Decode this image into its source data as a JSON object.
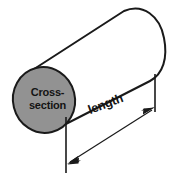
{
  "diagram": {
    "type": "geometry-illustration",
    "background_color": "#ffffff",
    "stroke_color": "#1a1a1a",
    "body_fill": "#ffffff",
    "cross_section_fill": "#929292",
    "text_color": "#141414",
    "labels": {
      "cross_section_line1": "Cross-",
      "cross_section_line2": "section",
      "length": "length"
    },
    "shapes": {
      "cross_section_ellipse": {
        "name": "cross-section-face",
        "center_x": 44,
        "center_y": 100,
        "radius_x": 31,
        "radius_y": 33,
        "rotation_deg": -14,
        "fill": "#929292",
        "stroke": "#1a1a1a",
        "stroke_width": 2
      },
      "cylinder_body": {
        "name": "cylinder-body",
        "top_edge_from": [
          31,
          71
        ],
        "top_edge_to": [
          124,
          11
        ],
        "bottom_edge_from": [
          58,
          128
        ],
        "bottom_edge_to": [
          150,
          70
        ],
        "right_cap_apex_x": 166,
        "fill": "#ffffff",
        "stroke": "#1a1a1a",
        "stroke_width": 2
      },
      "dimension_line": {
        "name": "length-dimension",
        "from": [
          68,
          163
        ],
        "to": [
          154,
          108
        ],
        "arrow_both_ends": true,
        "stroke": "#1a1a1a",
        "stroke_width": 1.2
      },
      "extension_line_left": {
        "name": "extension-line-left",
        "x": 66,
        "y_from": 117,
        "y_to": 173,
        "stroke": "#1a1a1a",
        "stroke_width": 1.6
      },
      "extension_line_right": {
        "name": "extension-line-right",
        "x": 155,
        "y_from": 74,
        "y_to": 112,
        "stroke": "#1a1a1a",
        "stroke_width": 1.6
      }
    }
  }
}
